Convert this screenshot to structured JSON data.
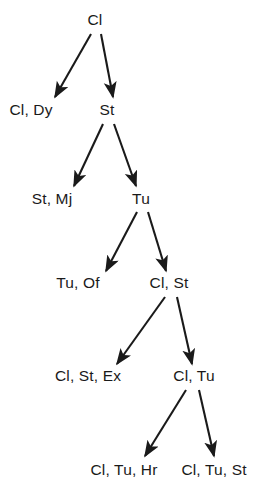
{
  "diagram": {
    "type": "tree",
    "background_color": "#ffffff",
    "text_color": "#1a1a1a",
    "edge_color": "#1a1a1a",
    "nodes": [
      {
        "id": "n0",
        "label": "Cl",
        "x": 95,
        "y": 20,
        "level": 0
      },
      {
        "id": "n1",
        "label": "Cl, Dy",
        "x": 31,
        "y": 110,
        "level": 1
      },
      {
        "id": "n2",
        "label": "St",
        "x": 107,
        "y": 110,
        "level": 1
      },
      {
        "id": "n3",
        "label": "St, Mj",
        "x": 52,
        "y": 199,
        "level": 2
      },
      {
        "id": "n4",
        "label": "Tu",
        "x": 141,
        "y": 199,
        "level": 2
      },
      {
        "id": "n5",
        "label": "Tu, Of",
        "x": 78,
        "y": 283,
        "level": 3
      },
      {
        "id": "n6",
        "label": "Cl, St",
        "x": 169,
        "y": 283,
        "level": 3
      },
      {
        "id": "n7",
        "label": "Cl, St, Ex",
        "x": 88,
        "y": 376,
        "level": 4
      },
      {
        "id": "n8",
        "label": "Cl, Tu",
        "x": 194,
        "y": 376,
        "level": 4
      },
      {
        "id": "n9",
        "label": "Cl, Tu, Hr",
        "x": 124,
        "y": 470,
        "level": 5
      },
      {
        "id": "n10",
        "label": "Cl, Tu, St",
        "x": 214,
        "y": 470,
        "level": 5
      }
    ],
    "edges": [
      {
        "from": "n0",
        "to": "n1",
        "x1": 91,
        "y1": 34,
        "x2": 55,
        "y2": 97
      },
      {
        "from": "n0",
        "to": "n2",
        "x1": 101,
        "y1": 34,
        "x2": 113,
        "y2": 97
      },
      {
        "from": "n2",
        "to": "n3",
        "x1": 103,
        "y1": 124,
        "x2": 74,
        "y2": 186
      },
      {
        "from": "n2",
        "to": "n4",
        "x1": 114,
        "y1": 124,
        "x2": 136,
        "y2": 186
      },
      {
        "from": "n4",
        "to": "n5",
        "x1": 137,
        "y1": 212,
        "x2": 106,
        "y2": 271
      },
      {
        "from": "n4",
        "to": "n6",
        "x1": 148,
        "y1": 212,
        "x2": 166,
        "y2": 271
      },
      {
        "from": "n6",
        "to": "n7",
        "x1": 165,
        "y1": 297,
        "x2": 117,
        "y2": 364
      },
      {
        "from": "n6",
        "to": "n8",
        "x1": 177,
        "y1": 297,
        "x2": 192,
        "y2": 364
      },
      {
        "from": "n8",
        "to": "n9",
        "x1": 186,
        "y1": 390,
        "x2": 145,
        "y2": 456
      },
      {
        "from": "n8",
        "to": "n10",
        "x1": 199,
        "y1": 390,
        "x2": 214,
        "y2": 456
      }
    ]
  }
}
